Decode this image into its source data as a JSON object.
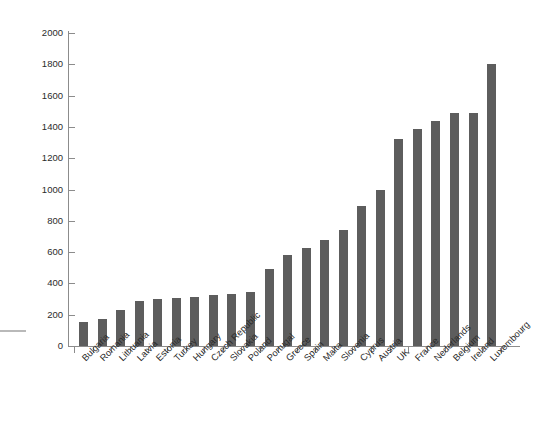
{
  "chart_data": {
    "type": "bar",
    "title": "",
    "subtitle": "",
    "xlabel": "",
    "ylabel": "",
    "ylim": [
      0,
      2000
    ],
    "ytick_step": 200,
    "yticks": [
      0,
      200,
      400,
      600,
      800,
      1000,
      1200,
      1400,
      1600,
      1800,
      2000
    ],
    "grid": false,
    "legend": null,
    "bar_color": "#5d5d5d",
    "axis_color": "#8c8c8c",
    "categories": [
      "Bulgaria",
      "Romania",
      "Lithuania",
      "Latvia",
      "Estonia",
      "Turkey",
      "Hungary",
      "Czech Republic",
      "Slovakia",
      "Poland",
      "Portugal",
      "Greece",
      "Spain",
      "Malta",
      "Slovenia",
      "Cyprus",
      "Austria",
      "UK",
      "France",
      "Nederlands",
      "Belgium",
      "Ireland",
      "Luxembourg"
    ],
    "values": [
      155,
      170,
      230,
      290,
      300,
      305,
      315,
      325,
      330,
      345,
      490,
      580,
      625,
      675,
      740,
      895,
      995,
      1320,
      1385,
      1440,
      1490,
      1490,
      1800
    ]
  }
}
